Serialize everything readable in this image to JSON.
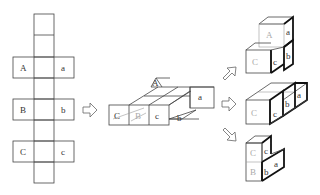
{
  "figure": {
    "net": {
      "labels": {
        "A": "A",
        "a": "a",
        "B": "B",
        "b": "b",
        "C": "C",
        "c": "c"
      }
    },
    "folding": {
      "labels": {
        "A": "A",
        "a": "a",
        "B": "B",
        "b": "b",
        "C": "C",
        "c": "c"
      }
    },
    "results": [
      {
        "labels": {
          "A": "A",
          "a": "a",
          "b": "b",
          "C": "C",
          "c": "c"
        }
      },
      {
        "labels": {
          "C": "C",
          "c": "c",
          "b": "b",
          "a": "a"
        }
      },
      {
        "labels": {
          "C": "C",
          "c": "c",
          "B": "B",
          "b": "b",
          "a": "a"
        }
      }
    ],
    "arrows": [
      "right-arrow",
      "up-right-arrow",
      "right-arrow",
      "down-right-arrow"
    ]
  }
}
